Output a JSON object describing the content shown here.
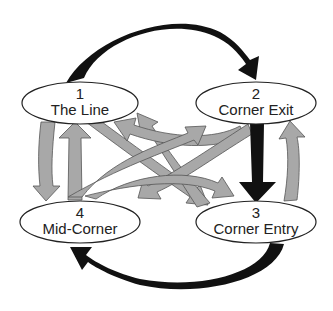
{
  "diagram": {
    "type": "cycle-flow",
    "colors": {
      "background": "#ffffff",
      "node_fill": "#ffffff",
      "node_stroke": "#222222",
      "primary_arrow": "#111111",
      "secondary_arrow": "#a8a8a8",
      "secondary_arrow_stroke": "#555555"
    },
    "nodes": [
      {
        "id": "1",
        "number": "1",
        "label": "The Line"
      },
      {
        "id": "2",
        "number": "2",
        "label": "Corner Exit"
      },
      {
        "id": "3",
        "number": "3",
        "label": "Corner Entry"
      },
      {
        "id": "4",
        "number": "4",
        "label": "Mid-Corner"
      }
    ],
    "primary_flow": [
      {
        "from": "1",
        "to": "2",
        "style": "black-curved-arrow-top"
      },
      {
        "from": "2",
        "to": "3",
        "style": "black-straight-arrow-right"
      },
      {
        "from": "3",
        "to": "4",
        "style": "black-curved-arrow-bottom"
      }
    ],
    "secondary_flow": [
      {
        "from": "1",
        "to": "4"
      },
      {
        "from": "4",
        "to": "1"
      },
      {
        "from": "1",
        "to": "3"
      },
      {
        "from": "3",
        "to": "1"
      },
      {
        "from": "2",
        "to": "1"
      },
      {
        "from": "4",
        "to": "2"
      },
      {
        "from": "2",
        "to": "4"
      },
      {
        "from": "4",
        "to": "3"
      },
      {
        "from": "3",
        "to": "2"
      }
    ]
  }
}
